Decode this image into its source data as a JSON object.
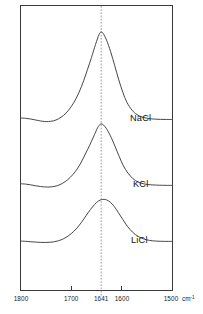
{
  "figure": {
    "kind": "ir-absorbance-spectra",
    "background_color": "#ffffff",
    "frame_color": "#3a3a3a",
    "curve_color": "#3c3c3c",
    "reference_line_color": "#8c8c8c"
  },
  "axis": {
    "unit_label": "cm",
    "unit_exponent": "-1",
    "tick_labels": [
      "1800",
      "1700",
      "1641",
      "1600",
      "1500"
    ],
    "tick_values": [
      1800,
      1700,
      1641,
      1600,
      1500
    ],
    "reference_tick": "1641"
  },
  "curves": [
    {
      "label": "NaCl"
    },
    {
      "label": "KCl"
    },
    {
      "label": "LiCl"
    }
  ],
  "chart_data": {
    "type": "line",
    "title": "",
    "subtitle": "",
    "xlabel": "cm-1",
    "ylabel": "",
    "xlim": [
      1800,
      1500
    ],
    "x_axis_reversed": true,
    "ylim": [
      0,
      1
    ],
    "grid": false,
    "legend_position": "inline-right",
    "annotations": [
      {
        "text": "1641",
        "type": "vertical-dashed-reference-line",
        "x": 1641
      }
    ],
    "x_ticks": [
      1800,
      1700,
      1641,
      1600,
      1500
    ],
    "x_tick_labels": [
      "1800",
      "1700",
      "1641",
      "1600",
      "1500"
    ],
    "series": [
      {
        "name": "NaCl",
        "peak_position": 1641,
        "peak_height": 1.0,
        "baseline": 0.0,
        "shoulder_dip_position": 1752,
        "x": [
          1800,
          1790,
          1780,
          1770,
          1760,
          1752,
          1745,
          1735,
          1725,
          1715,
          1705,
          1695,
          1685,
          1675,
          1668,
          1660,
          1652,
          1645,
          1641,
          1637,
          1630,
          1622,
          1614,
          1606,
          1598,
          1590,
          1580,
          1570,
          1560,
          1548,
          1536,
          1524,
          1512,
          1500
        ],
        "y": [
          0.055,
          0.052,
          0.044,
          0.033,
          0.022,
          0.016,
          0.016,
          0.024,
          0.046,
          0.084,
          0.142,
          0.222,
          0.33,
          0.47,
          0.585,
          0.718,
          0.862,
          0.972,
          1.0,
          0.985,
          0.908,
          0.782,
          0.63,
          0.474,
          0.336,
          0.228,
          0.142,
          0.092,
          0.066,
          0.05,
          0.043,
          0.04,
          0.039,
          0.039
        ]
      },
      {
        "name": "KCl",
        "peak_position": 1641,
        "peak_height": 0.755,
        "baseline": 0.0,
        "shoulder_dip_position": 1745,
        "x": [
          1800,
          1790,
          1780,
          1770,
          1760,
          1750,
          1742,
          1732,
          1722,
          1712,
          1702,
          1692,
          1682,
          1672,
          1664,
          1656,
          1648,
          1643,
          1641,
          1636,
          1629,
          1621,
          1613,
          1605,
          1597,
          1588,
          1578,
          1568,
          1556,
          1544,
          1532,
          1520,
          1510,
          1500
        ],
        "y": [
          0.05,
          0.046,
          0.037,
          0.026,
          0.017,
          0.012,
          0.012,
          0.02,
          0.04,
          0.074,
          0.124,
          0.192,
          0.283,
          0.4,
          0.496,
          0.601,
          0.707,
          0.748,
          0.755,
          0.74,
          0.686,
          0.595,
          0.484,
          0.368,
          0.262,
          0.176,
          0.11,
          0.07,
          0.048,
          0.038,
          0.034,
          0.032,
          0.031,
          0.031
        ]
      },
      {
        "name": "LiCl",
        "peak_position": 1635,
        "peak_height": 0.545,
        "baseline": 0.0,
        "shoulder_dip_position": 1738,
        "x": [
          1800,
          1790,
          1780,
          1770,
          1760,
          1750,
          1740,
          1730,
          1720,
          1710,
          1700,
          1690,
          1680,
          1670,
          1662,
          1654,
          1646,
          1640,
          1635,
          1630,
          1623,
          1615,
          1607,
          1598,
          1589,
          1579,
          1568,
          1557,
          1545,
          1533,
          1521,
          1511,
          1500
        ],
        "y": [
          0.03,
          0.027,
          0.022,
          0.017,
          0.014,
          0.013,
          0.016,
          0.026,
          0.045,
          0.076,
          0.121,
          0.181,
          0.258,
          0.349,
          0.419,
          0.48,
          0.525,
          0.542,
          0.545,
          0.538,
          0.511,
          0.457,
          0.383,
          0.296,
          0.212,
          0.141,
          0.088,
          0.056,
          0.038,
          0.03,
          0.027,
          0.026,
          0.026
        ]
      }
    ]
  }
}
